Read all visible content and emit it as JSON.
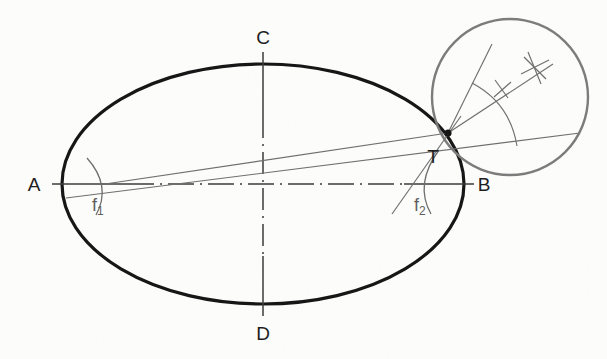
{
  "figure": {
    "background_color": "#fdfdfc",
    "width": 607,
    "height": 359
  },
  "colors": {
    "outline": "#141414",
    "construction": "#6e6e6e",
    "axis": "#3a3a3a",
    "detail_circle": "#777777",
    "label": "#1b1b1b",
    "label_construction": "#5d5d5d"
  },
  "labels": {
    "vertex_a": "A",
    "vertex_b": "B",
    "vertex_c": "C",
    "vertex_d": "D",
    "tangent_point": "T",
    "focus_1": "f",
    "focus_1_sub": "1",
    "focus_2": "f",
    "focus_2_sub": "2"
  },
  "geometry": {
    "ellipse": {
      "center_x": 263,
      "center_y": 184,
      "semi_major": 201,
      "semi_minor": 120,
      "stroke_width": 3.2
    },
    "major_axis": {
      "x1": 52,
      "y1": 184,
      "x2": 474,
      "y2": 184
    },
    "minor_axis": {
      "x1": 263,
      "y1": 52,
      "x2": 263,
      "y2": 316
    },
    "focus_1": {
      "x": 105,
      "y": 184
    },
    "focus_2": {
      "x": 424,
      "y": 184
    },
    "tangent_point": {
      "x": 448,
      "y": 133
    },
    "detail_circle": {
      "cx": 510,
      "cy": 97,
      "r": 78
    },
    "tangent_line": {
      "x1": 68,
      "y1": 197,
      "x2": 578,
      "y2": 134
    },
    "focal_ray_1": {
      "x1": 105,
      "y1": 184,
      "x2": 448,
      "y2": 133
    },
    "focal_ray_2": {
      "x1": 394,
      "y1": 210,
      "x2": 448,
      "y2": 133
    },
    "bisector_ray": {
      "x1": 448,
      "y1": 133,
      "x2": 548,
      "y2": 66
    },
    "normal_ray": {
      "x1": 448,
      "y1": 133,
      "x2": 493,
      "y2": 45
    }
  },
  "annotations": {
    "focus_arc_1": "compass arc through focus f1",
    "focus_arc_2": "compass arc through focus f2",
    "bisector_arc": "arc centered at T crossing both rays",
    "cross_mark_1": "compass intersection tick",
    "cross_mark_2": "compass intersection asterisk"
  }
}
